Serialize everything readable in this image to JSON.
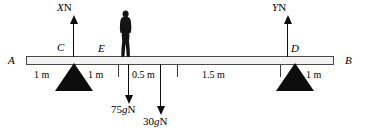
{
  "diagram": {
    "beam": {
      "left_endpoint_label": "A",
      "right_endpoint_label": "B",
      "point_labels": [
        "C",
        "E",
        "D"
      ],
      "color": "#f2f2f2",
      "outline_color": "#4a4a4a"
    },
    "supports": [
      {
        "name": "support-at-C",
        "label": "C",
        "color": "#0d0d0d"
      },
      {
        "name": "support-at-D",
        "label": "D",
        "color": "#0d0d0d"
      }
    ],
    "forces": [
      {
        "id": "X",
        "symbol": "X",
        "unit": "N",
        "direction": "up",
        "at": "C"
      },
      {
        "id": "Y",
        "symbol": "Y",
        "unit": "N",
        "direction": "up",
        "at": "D"
      },
      {
        "id": "75g",
        "symbol": "75g",
        "unit": "N",
        "direction": "down",
        "at": "E"
      },
      {
        "id": "30g",
        "symbol": "30g",
        "unit": "N",
        "direction": "down",
        "at": "beam-centre"
      }
    ],
    "force_labels": {
      "x": {
        "value": "X",
        "unit": "N"
      },
      "y": {
        "value": "Y",
        "unit": "N"
      },
      "person_weight": {
        "coefficient": "75",
        "g": "g",
        "unit": "N"
      },
      "beam_weight": {
        "coefficient": "30",
        "g": "g",
        "unit": "N"
      }
    },
    "distances": [
      {
        "label": "1 m",
        "x": 34,
        "from": "A",
        "to": "C"
      },
      {
        "label": "1 m",
        "x": 88,
        "from": "C",
        "to": "E"
      },
      {
        "label": "0.5 m",
        "x": 132,
        "from": "E",
        "to": "beam-centre"
      },
      {
        "label": "1.5 m",
        "x": 202,
        "from": "beam-centre",
        "to": "D"
      },
      {
        "label": "1 m",
        "x": 306,
        "from": "D",
        "to": "B"
      }
    ],
    "tick_positions": [
      118,
      177,
      280
    ],
    "person": {
      "name": "person-silhouette",
      "color": "#141414"
    }
  }
}
